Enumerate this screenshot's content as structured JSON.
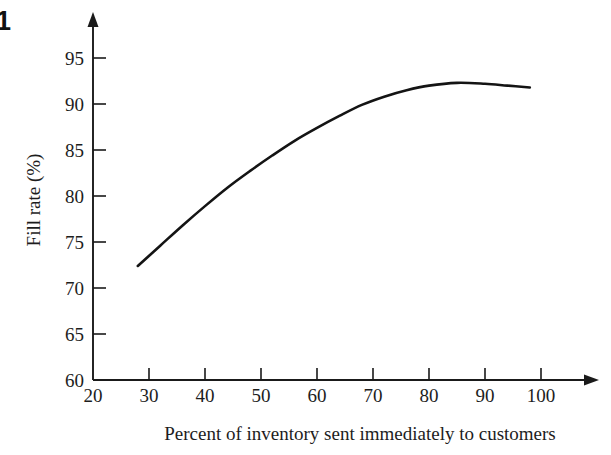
{
  "figure": {
    "number_label": "1"
  },
  "chart_data": {
    "type": "line",
    "title": "",
    "xlabel": "Percent of inventory sent immediately to customers",
    "ylabel": "Fill rate (%)",
    "xlim": [
      20,
      102
    ],
    "ylim": [
      60,
      97
    ],
    "grid": false,
    "legend": null,
    "xticks": [
      20,
      30,
      40,
      50,
      60,
      70,
      80,
      90,
      100
    ],
    "xtick_labels": [
      "20",
      "30",
      "40",
      "50",
      "60",
      "70",
      "80",
      "90",
      "100"
    ],
    "yticks": [
      60,
      65,
      70,
      75,
      80,
      85,
      90,
      95
    ],
    "ytick_labels": [
      "60",
      "65",
      "70",
      "75",
      "80",
      "85",
      "90",
      "95"
    ],
    "series": [
      {
        "name": "Fill rate",
        "color": "#141414",
        "x": [
          28,
          32,
          36,
          40,
          44,
          48,
          52,
          56,
          60,
          64,
          68,
          72,
          76,
          80,
          85,
          90,
          94,
          98
        ],
        "y": [
          72.4,
          74.6,
          76.8,
          78.9,
          80.9,
          82.7,
          84.4,
          86.0,
          87.4,
          88.7,
          89.9,
          90.8,
          91.5,
          92.0,
          92.3,
          92.2,
          92.0,
          91.8
        ]
      }
    ]
  }
}
